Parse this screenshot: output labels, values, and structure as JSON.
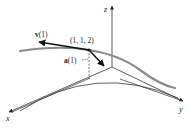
{
  "figure": {
    "axes": {
      "x_label": "x",
      "y_label": "y",
      "z_label": "z"
    },
    "point": {
      "label": "(1, 1, 2)"
    },
    "vectors": {
      "velocity": {
        "label_bold": "v",
        "label_rest": "(1)"
      },
      "acceleration": {
        "label_bold": "a",
        "label_rest": "(1)"
      }
    },
    "colors": {
      "curve": "#8a8a8a",
      "axes": "#333333",
      "vectors": "#111111",
      "background": "#ffffff"
    }
  }
}
